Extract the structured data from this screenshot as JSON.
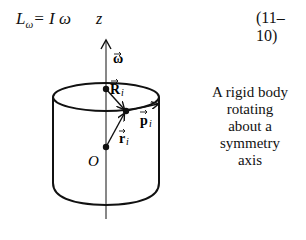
{
  "equation": {
    "lhs": "L",
    "lhs_subscript": "ω",
    "rhs": "= I ω",
    "number": "(11–10)"
  },
  "diagram": {
    "axis_label": "z",
    "vectors": [
      {
        "name": "omega",
        "label": "ω"
      },
      {
        "name": "R",
        "label": "R",
        "subscript": "i"
      },
      {
        "name": "p",
        "label": "p",
        "subscript": "i"
      },
      {
        "name": "r",
        "label": "r",
        "subscript": "i"
      }
    ],
    "origin_label": "O"
  },
  "caption": {
    "lines": [
      "A rigid body",
      "rotating",
      "about a",
      "symmetry",
      "axis"
    ]
  }
}
